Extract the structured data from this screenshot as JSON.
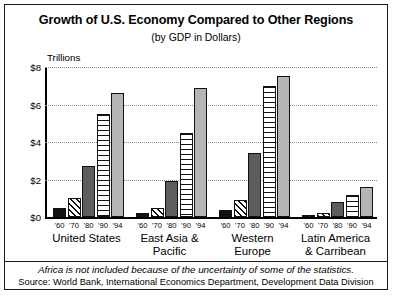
{
  "chart_data": {
    "type": "bar",
    "title": "Growth of U.S. Economy Compared to Other Regions",
    "subtitle": "(by GDP in Dollars)",
    "unit_label": "Trillions",
    "xlabel": "",
    "ylabel": "",
    "ylim": [
      0,
      8
    ],
    "grid": true,
    "legend_position": "none",
    "ytick_labels": [
      "$0",
      "$2",
      "$4",
      "$6",
      "$8"
    ],
    "ytick_values": [
      0,
      2,
      4,
      6,
      8
    ],
    "categories": [
      "United States",
      "East Asia & Pacific",
      "Western Europe",
      "Latin America & Carribean"
    ],
    "category_lines": [
      [
        "United States"
      ],
      [
        "East Asia &",
        "Pacific"
      ],
      [
        "Western",
        "Europe"
      ],
      [
        "Latin America",
        "& Carribean"
      ]
    ],
    "x": [
      "'60",
      "'70",
      "'80",
      "'90",
      "'94"
    ],
    "series": [
      {
        "name": "'60",
        "pattern": "solid-black",
        "values": [
          0.5,
          0.2,
          0.4,
          0.1
        ]
      },
      {
        "name": "'70",
        "pattern": "diagonal-hatch",
        "values": [
          1.0,
          0.5,
          0.9,
          0.2
        ]
      },
      {
        "name": "'80",
        "pattern": "dark-gray",
        "values": [
          2.7,
          1.9,
          3.4,
          0.8
        ]
      },
      {
        "name": "'90",
        "pattern": "horizontal-stripe",
        "values": [
          5.5,
          4.5,
          7.0,
          1.2
        ]
      },
      {
        "name": "'94",
        "pattern": "light-gray",
        "values": [
          6.6,
          6.9,
          7.5,
          1.6
        ]
      }
    ],
    "footnote": "Africa is not included because of the uncertainty of some of the statistics.",
    "source": "Source: World Bank, International Economics Department, Development Data Division",
    "colors": {
      "solid_black": "#111111",
      "dark_gray": "#5d5d5d",
      "light_gray": "#b5b5b5",
      "background": "#ffffff",
      "axis": "#000000",
      "gridline": "#8a8a8a"
    }
  }
}
